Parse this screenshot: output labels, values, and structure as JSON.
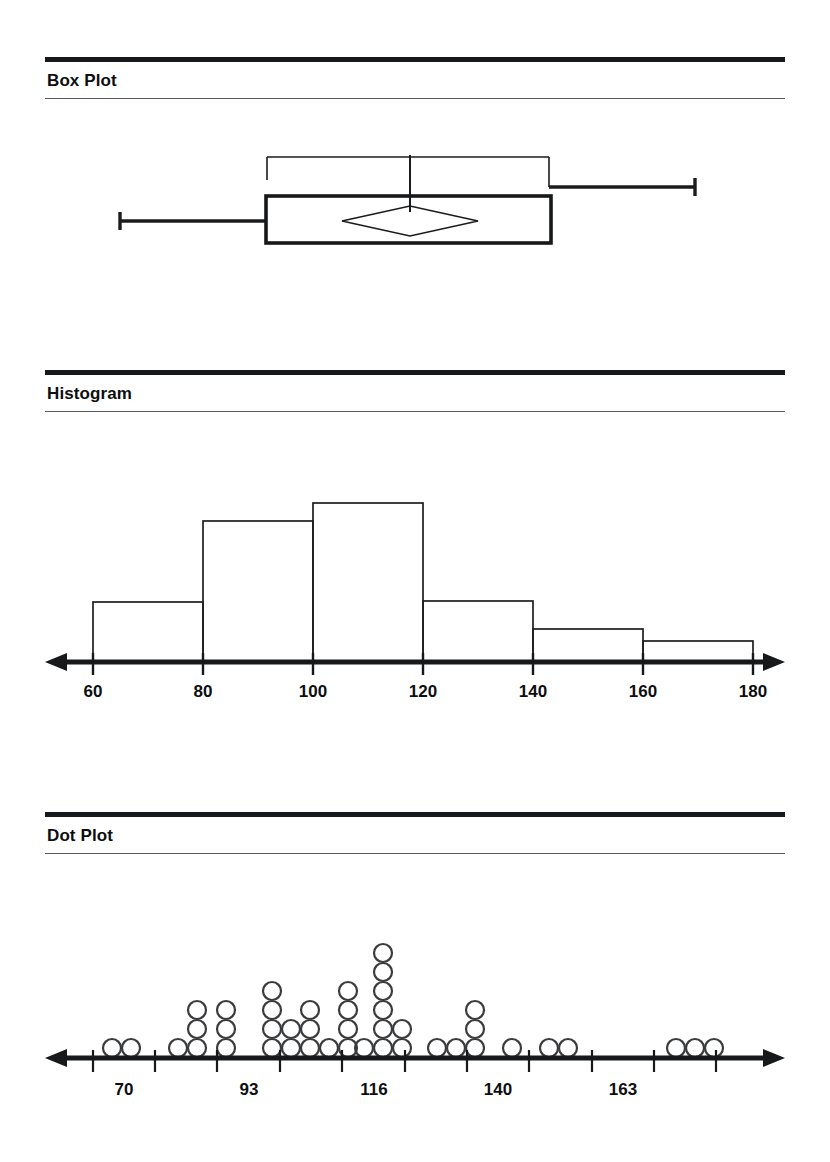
{
  "page": {
    "background": "#ffffff",
    "ink": "#000000"
  },
  "panels": [
    {
      "id": "box-plot",
      "title": "Box Plot"
    },
    {
      "id": "histogram",
      "title": "Histogram"
    },
    {
      "id": "dot-plot",
      "title": "Dot Plot"
    }
  ],
  "chart_data": [
    {
      "type": "box",
      "title": "Box Plot",
      "xlabel": "",
      "ylabel": "",
      "orientation": "horizontal",
      "grid": false,
      "axis_shown": false,
      "box": {
        "min": 60,
        "q1": 93,
        "median": 115,
        "q3": 145,
        "max": 180,
        "mean": 115,
        "mean_marker": "diamond",
        "mean_diamond_left": 108,
        "mean_diamond_right": 136
      },
      "confidence_bracket": {
        "left": 98,
        "right": 145,
        "note": "thin upper bracket spanning the inter-quartile style band"
      },
      "pixel_geometry": {
        "left_whisker_cap_x": 120,
        "box_left_x": 266,
        "box_right_x": 551,
        "right_whisker_cap_x": 695,
        "median_line_x": 410,
        "box_top_y": 196,
        "box_bottom_y": 243,
        "whisker_y": 221,
        "bracket_top_y": 157,
        "bracket_left_x": 267,
        "bracket_right_x": 549,
        "bracket_bottom_y": 180,
        "upper_whisker_y": 187,
        "diamond_left_x": 342,
        "diamond_right_x": 478,
        "diamond_center_x": 410,
        "diamond_top_y": 206,
        "diamond_bottom_y": 236
      }
    },
    {
      "type": "bar",
      "subtype": "histogram",
      "title": "Histogram",
      "xlabel": "",
      "ylabel": "",
      "grid": false,
      "bin_width": 20,
      "bin_edges": [
        60,
        80,
        100,
        120,
        140,
        160,
        180
      ],
      "categories": [
        "60-80",
        "80-100",
        "100-120",
        "120-140",
        "140-160",
        "160-180"
      ],
      "values": [
        4,
        9.5,
        11,
        4,
        2.5,
        1.5
      ],
      "bar_top_pixels": [
        602,
        521,
        503,
        601,
        629,
        641
      ],
      "baseline_pixel": 662,
      "xticks": [
        60,
        80,
        100,
        120,
        140,
        160,
        180
      ],
      "xtick_labels": [
        "60",
        "80",
        "100",
        "120",
        "140",
        "160",
        "180"
      ],
      "xtick_pixels": [
        93,
        203,
        313,
        423,
        533,
        643,
        753
      ],
      "xlim": [
        60,
        180
      ],
      "axis_arrows": "both"
    },
    {
      "type": "dotplot",
      "title": "Dot Plot",
      "xlabel": "",
      "ylabel": "",
      "grid": false,
      "dot_radius_px": 9,
      "dot_pitch_x_px": 19,
      "dot_pitch_y_px": 19,
      "baseline_pixel": 1058,
      "xticks_labeled": [
        70,
        93,
        116,
        140,
        163
      ],
      "xtick_labels": [
        "70",
        "93",
        "116",
        "140",
        "163"
      ],
      "xtick_label_pixels": [
        124,
        249,
        374,
        498,
        623
      ],
      "xtick_pixels": [
        93,
        155,
        217,
        280,
        342,
        405,
        467,
        529,
        592,
        654,
        716
      ],
      "axis_arrows": "both",
      "stacks": [
        {
          "x_px": 112,
          "count": 1
        },
        {
          "x_px": 131,
          "count": 1
        },
        {
          "x_px": 178,
          "count": 1
        },
        {
          "x_px": 197,
          "count": 3
        },
        {
          "x_px": 226,
          "count": 3
        },
        {
          "x_px": 272,
          "count": 4
        },
        {
          "x_px": 291,
          "count": 2
        },
        {
          "x_px": 310,
          "count": 3
        },
        {
          "x_px": 329,
          "count": 1
        },
        {
          "x_px": 348,
          "count": 4
        },
        {
          "x_px": 364,
          "count": 1
        },
        {
          "x_px": 383,
          "count": 6
        },
        {
          "x_px": 402,
          "count": 2
        },
        {
          "x_px": 437,
          "count": 1
        },
        {
          "x_px": 456,
          "count": 1
        },
        {
          "x_px": 475,
          "count": 3
        },
        {
          "x_px": 512,
          "count": 1
        },
        {
          "x_px": 549,
          "count": 1
        },
        {
          "x_px": 568,
          "count": 1
        },
        {
          "x_px": 676,
          "count": 1
        },
        {
          "x_px": 695,
          "count": 1
        },
        {
          "x_px": 714,
          "count": 1
        }
      ],
      "total_dots": 43
    }
  ]
}
